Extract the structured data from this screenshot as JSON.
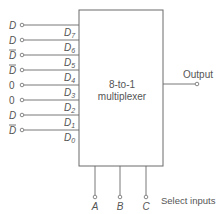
{
  "diagram": {
    "title_line1": "8-to-1",
    "title_line2": "multiplexer",
    "output_label": "Output",
    "select_label": "Select inputs",
    "inputs": [
      {
        "value": "D",
        "bar": false,
        "pin": "D",
        "sub": "7"
      },
      {
        "value": "D",
        "bar": false,
        "pin": "D",
        "sub": "6"
      },
      {
        "value": "D",
        "bar": true,
        "pin": "D",
        "sub": "5"
      },
      {
        "value": "D",
        "bar": true,
        "pin": "D",
        "sub": "4"
      },
      {
        "value": "0",
        "bar": false,
        "pin": "D",
        "sub": "3"
      },
      {
        "value": "0",
        "bar": false,
        "pin": "D",
        "sub": "2"
      },
      {
        "value": "D",
        "bar": false,
        "pin": "D",
        "sub": "1"
      },
      {
        "value": "D",
        "bar": true,
        "pin": "D",
        "sub": "0"
      }
    ],
    "selects": [
      "A",
      "B",
      "C"
    ],
    "colors": {
      "line": "#6a6a6a",
      "text": "#555555"
    }
  }
}
